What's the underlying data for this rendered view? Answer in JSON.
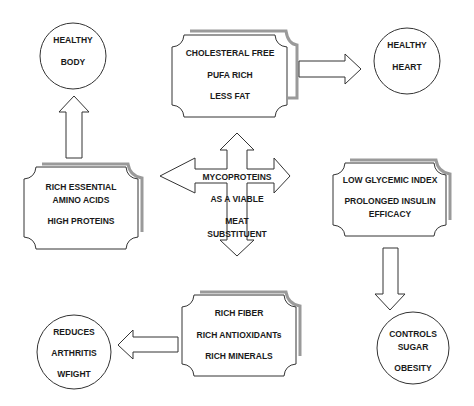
{
  "diagram": {
    "colors": {
      "stroke": "#333333",
      "shadow": "#9a9a9a",
      "fill": "#ffffff",
      "text": "#1a1a1a"
    },
    "center": {
      "lines": [
        "MYCOPROTEINS",
        "AS A VIABLE",
        "MEAT",
        "SUBSTITUENT"
      ]
    },
    "boxes": {
      "top": {
        "lines": [
          "CHOLESTERAL FREE",
          "PUFA RICH",
          "LESS FAT"
        ]
      },
      "left": {
        "lines": [
          "RICH ESSENTIAL",
          "AMINO ACIDS",
          "HIGH PROTEINS"
        ]
      },
      "right": {
        "lines": [
          "LOW GLYCEMIC INDEX",
          "PROLONGED INSULIN",
          "EFFICACY"
        ]
      },
      "bottom": {
        "lines": [
          "RICH FIBER",
          "RICH ANTIOXIDANTs",
          "RICH MINERALS"
        ]
      }
    },
    "circles": {
      "healthy_body": {
        "lines": [
          "HEALTHY",
          "BODY"
        ]
      },
      "healthy_heart": {
        "lines": [
          "HEALTHY",
          "HEART"
        ]
      },
      "controls": {
        "lines": [
          "CONTROLS",
          "SUGAR",
          "OBESITY"
        ]
      },
      "reduces": {
        "lines": [
          "REDUCES",
          "ARTHRITIS",
          "WFIGHT"
        ]
      }
    },
    "connections": [
      {
        "from": "boxes.left",
        "to": "circles.healthy_body",
        "direction": "up"
      },
      {
        "from": "boxes.top",
        "to": "circles.healthy_heart",
        "direction": "right"
      },
      {
        "from": "boxes.right",
        "to": "circles.controls",
        "direction": "down"
      },
      {
        "from": "boxes.bottom",
        "to": "circles.reduces",
        "direction": "left"
      }
    ]
  }
}
